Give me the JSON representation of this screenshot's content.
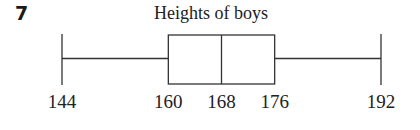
{
  "question": {
    "number": "7"
  },
  "chart_data": {
    "type": "boxplot",
    "title": "Heights of boys",
    "xlabel": "",
    "ylabel": "",
    "min": 144,
    "q1": 160,
    "median": 168,
    "q3": 176,
    "max": 192,
    "tick_labels": [
      "144",
      "160",
      "168",
      "176",
      "192"
    ],
    "grid": false,
    "line_color": "#333333"
  }
}
